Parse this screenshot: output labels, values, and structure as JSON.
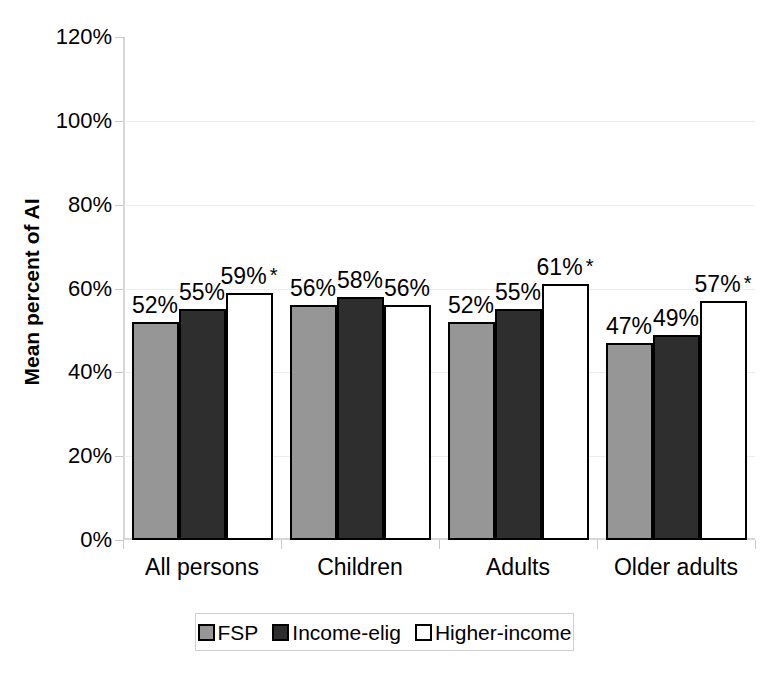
{
  "chart_data": {
    "type": "bar",
    "title": "",
    "subtitle": "",
    "xlabel": "",
    "ylabel": "Mean percent of AI",
    "ylim": [
      0,
      120
    ],
    "ytick_labels": [
      "120%",
      "100%",
      "80%",
      "60%",
      "40%",
      "20%",
      "0%"
    ],
    "ytick_values": [
      120,
      100,
      80,
      60,
      40,
      20,
      0
    ],
    "grid": true,
    "legend_position": "bottom",
    "categories": [
      "All persons",
      "Children",
      "Adults",
      "Older adults"
    ],
    "series": [
      {
        "name": "FSP",
        "color": "#969696",
        "values": [
          52,
          56,
          52,
          47
        ],
        "labels": [
          "52%",
          "56%",
          "52%",
          "47%"
        ],
        "significance": [
          "",
          "",
          "",
          ""
        ]
      },
      {
        "name": "Income-elig",
        "color": "#2e2e2e",
        "values": [
          55,
          58,
          55,
          49
        ],
        "labels": [
          "55%",
          "58%",
          "55%",
          "49%"
        ],
        "significance": [
          "",
          "",
          "",
          ""
        ]
      },
      {
        "name": "Higher-income",
        "color": "#ffffff",
        "values": [
          59,
          56,
          61,
          57
        ],
        "labels": [
          "59%",
          "56%",
          "61%",
          "57%"
        ],
        "significance": [
          "*",
          "",
          "*",
          "*"
        ]
      }
    ],
    "annotations": {
      "significance_marker": "*"
    }
  },
  "legend": {
    "items": [
      {
        "label": "FSP",
        "color": "#969696"
      },
      {
        "label": "Income-elig",
        "color": "#2e2e2e"
      },
      {
        "label": "Higher-income",
        "color": "#ffffff"
      }
    ]
  },
  "colors": {
    "fsp": "#969696",
    "income_elig": "#2e2e2e",
    "higher_income": "#ffffff",
    "axis": "#d6d6d6",
    "grid": "#ededed",
    "text": "#000000"
  }
}
